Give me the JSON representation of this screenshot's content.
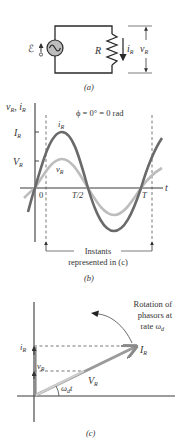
{
  "panel_a": {
    "caption": "(a)",
    "emf_symbol": "ℰ",
    "resistor_label": "R",
    "current_label": "i",
    "current_sub": "R",
    "voltage_label": "v",
    "voltage_sub": "R"
  },
  "panel_b": {
    "caption": "(b)",
    "y_axis_label": "v",
    "y_axis_sub1": "R",
    "y_axis_sep": ", i",
    "y_axis_sub2": "R",
    "x_axis_label": "t",
    "phase_text": "ϕ = 0° = 0 rad",
    "tick_I": "I",
    "tick_I_sub": "R",
    "tick_V": "V",
    "tick_V_sub": "R",
    "curve_i_label": "i",
    "curve_i_sub": "R",
    "curve_v_label": "v",
    "curve_v_sub": "R",
    "x_tick_0": "0",
    "x_tick_half": "T/2",
    "x_tick_T": "T",
    "instants_line1": "Instants",
    "instants_line2": "represented in (c)",
    "colors": {
      "current": "#6a6a6a",
      "voltage": "#bdbdbd"
    }
  },
  "panel_c": {
    "caption": "(c)",
    "rotation_line1": "Rotation of",
    "rotation_line2": "phasors at",
    "rotation_line3": "rate ω",
    "rotation_sub": "d",
    "proj_i": "i",
    "proj_i_sub": "R",
    "proj_v": "v",
    "proj_v_sub": "R",
    "phasor_I": "I",
    "phasor_I_sub": "R",
    "phasor_V": "V",
    "phasor_V_sub": "R",
    "angle_label": "ω",
    "angle_sub": "d",
    "angle_t": "t"
  }
}
